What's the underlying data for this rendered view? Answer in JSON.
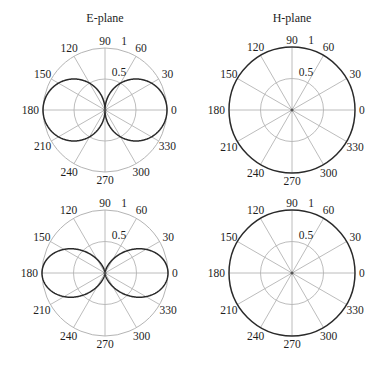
{
  "chart_data": [
    {
      "type": "polar-line",
      "title": "E-plane",
      "panel": "top-left",
      "center": [
        105,
        110
      ],
      "radius": 62,
      "pattern": "|cos(theta)|",
      "rlim": [
        0,
        1
      ],
      "radial_ticks": [
        0.5,
        1
      ],
      "radial_tick_labels": [
        "0.5",
        "1"
      ],
      "angle_ticks": [
        0,
        30,
        60,
        90,
        120,
        150,
        180,
        210,
        240,
        270,
        300,
        330
      ],
      "series": [
        {
          "name": "E-plane pattern",
          "theta_deg": [
            0,
            30,
            60,
            90,
            120,
            150,
            180,
            210,
            240,
            270,
            300,
            330
          ],
          "r": [
            1.0,
            0.866,
            0.5,
            0.0,
            0.5,
            0.866,
            1.0,
            0.866,
            0.5,
            0.0,
            0.5,
            0.866
          ]
        }
      ],
      "outer_ring_dark": false
    },
    {
      "type": "polar-line",
      "title": "H-plane",
      "panel": "top-right",
      "center": [
        292,
        110
      ],
      "radius": 63,
      "pattern": "1",
      "rlim": [
        0,
        1
      ],
      "radial_ticks": [
        0.5,
        1
      ],
      "radial_tick_labels": [
        "0.5",
        "1"
      ],
      "angle_ticks": [
        0,
        30,
        60,
        90,
        120,
        150,
        180,
        210,
        240,
        270,
        300,
        330
      ],
      "series": [
        {
          "name": "H-plane pattern",
          "theta_deg": [
            0,
            30,
            60,
            90,
            120,
            150,
            180,
            210,
            240,
            270,
            300,
            330
          ],
          "r": [
            1,
            1,
            1,
            1,
            1,
            1,
            1,
            1,
            1,
            1,
            1,
            1
          ]
        }
      ],
      "outer_ring_dark": true
    },
    {
      "type": "polar-line",
      "title": "",
      "panel": "bottom-left",
      "center": [
        105,
        273
      ],
      "radius": 63,
      "pattern": "cos^2(theta)",
      "rlim": [
        0,
        1
      ],
      "radial_ticks": [
        0.5,
        1
      ],
      "radial_tick_labels": [
        "0.5",
        "1"
      ],
      "angle_ticks": [
        0,
        30,
        60,
        90,
        120,
        150,
        180,
        210,
        240,
        270,
        300,
        330
      ],
      "series": [
        {
          "name": "E-plane pattern",
          "theta_deg": [
            0,
            30,
            60,
            90,
            120,
            150,
            180,
            210,
            240,
            270,
            300,
            330
          ],
          "r": [
            1.0,
            0.75,
            0.25,
            0.0,
            0.25,
            0.75,
            1.0,
            0.75,
            0.25,
            0.0,
            0.25,
            0.75
          ]
        }
      ],
      "outer_ring_dark": false
    },
    {
      "type": "polar-line",
      "title": "",
      "panel": "bottom-right",
      "center": [
        292,
        273
      ],
      "radius": 63,
      "pattern": "1",
      "rlim": [
        0,
        1
      ],
      "radial_ticks": [
        0.5,
        1
      ],
      "radial_tick_labels": [
        "0.5",
        "1"
      ],
      "angle_ticks": [
        0,
        30,
        60,
        90,
        120,
        150,
        180,
        210,
        240,
        270,
        300,
        330
      ],
      "series": [
        {
          "name": "H-plane pattern",
          "theta_deg": [
            0,
            30,
            60,
            90,
            120,
            150,
            180,
            210,
            240,
            270,
            300,
            330
          ],
          "r": [
            1,
            1,
            1,
            1,
            1,
            1,
            1,
            1,
            1,
            1,
            1,
            1
          ]
        }
      ],
      "outer_ring_dark": true
    }
  ]
}
